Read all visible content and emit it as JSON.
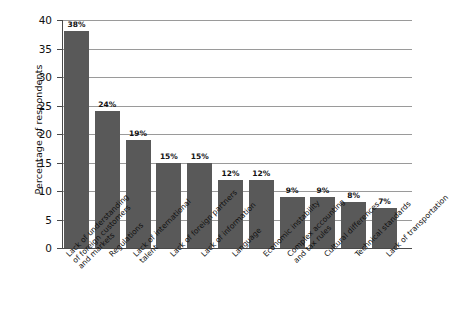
{
  "chart_data": {
    "type": "bar",
    "title": "",
    "subtitle": "",
    "xlabel": "",
    "ylabel": "Percentage of respondents",
    "ylim": [
      0,
      40
    ],
    "ytick_step": 5,
    "ytick_labels": [
      "0",
      "5",
      "10",
      "15",
      "20",
      "25",
      "30",
      "35",
      "40"
    ],
    "grid": true,
    "grid_axis": "y",
    "legend": false,
    "legend_position": "none",
    "bar_color": "#595959",
    "gridline_color": "#9a9a9a",
    "axis_color": "#4a4a4a",
    "background_color": "#ffffff",
    "value_label_suffix": "%",
    "categories": [
      "Lack of understanding of foreign customers and markets",
      "Regulations",
      "Lack of international talent",
      "Lack of foreign partners",
      "Lack of information",
      "Language",
      "Economic instability",
      "Complex accounting and tax rules",
      "Cultural differences",
      "Technical standards",
      "Lack of transportation"
    ],
    "category_label_lines": [
      [
        "Lack of understanding",
        "of foreign customers",
        "and markets"
      ],
      [
        "Regulations"
      ],
      [
        "Lack of international",
        "talent"
      ],
      [
        "Lack of foreign partners"
      ],
      [
        "Lack of information"
      ],
      [
        "Language"
      ],
      [
        "Economic instability"
      ],
      [
        "Complex accounting",
        "and tax rules"
      ],
      [
        "Cultural differences"
      ],
      [
        "Technical standards"
      ],
      [
        "Lack of transportation"
      ]
    ],
    "values": [
      38,
      24,
      19,
      15,
      15,
      12,
      12,
      9,
      9,
      8,
      7
    ],
    "value_labels": [
      "38%",
      "24%",
      "19%",
      "15%",
      "15%",
      "12%",
      "12%",
      "9%",
      "9%",
      "8%",
      "7%"
    ]
  }
}
